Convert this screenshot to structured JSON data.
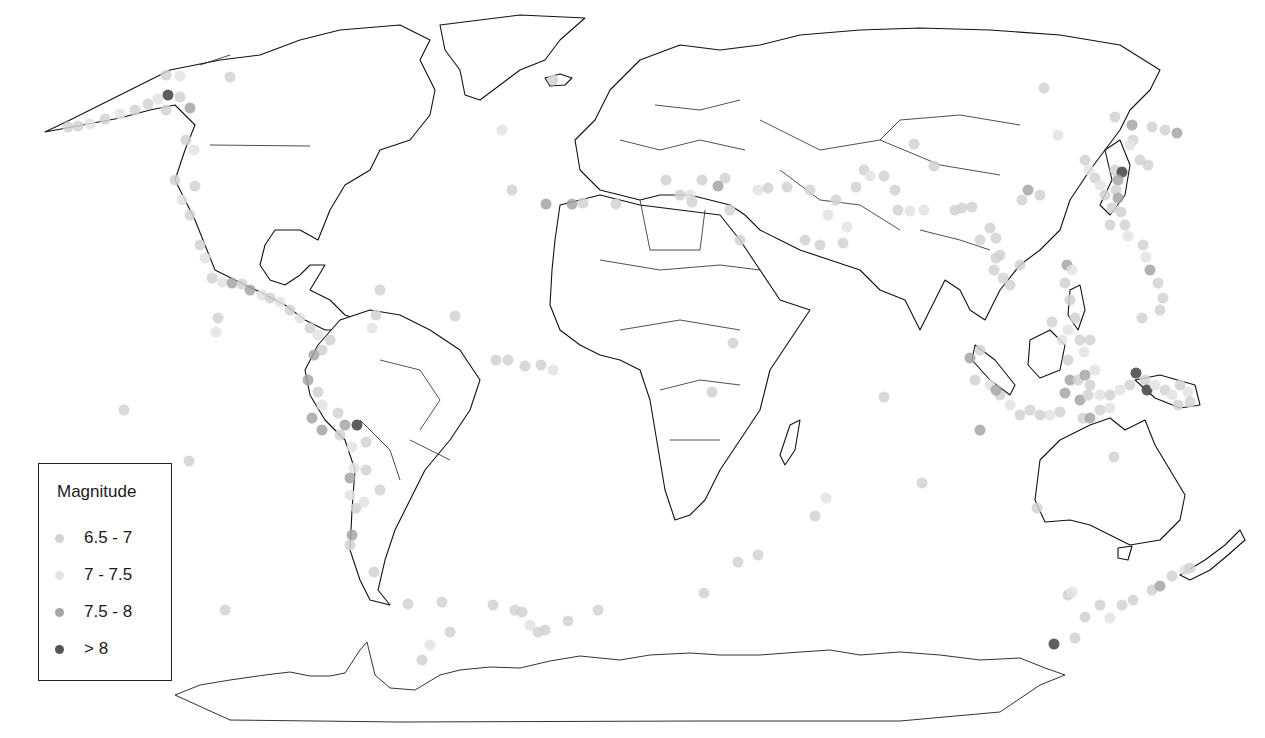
{
  "map": {
    "type": "world earthquake map",
    "projection": "equirectangular (approx)"
  },
  "legend": {
    "title": "Magnitude",
    "items": [
      {
        "label": "6.5 - 7",
        "color": "#d2d2d2"
      },
      {
        "label": "7 - 7.5",
        "color": "#e3e3e3"
      },
      {
        "label": "7.5 - 8",
        "color": "#a6a6a6"
      },
      {
        "label": "> 8",
        "color": "#555555"
      }
    ]
  },
  "colors": {
    "m65": "#d2d2d2",
    "m70": "#e3e3e3",
    "m75": "#a6a6a6",
    "m80": "#555555",
    "outline": "#111111"
  },
  "points": [
    {
      "x": 68,
      "y": 127,
      "c": "m65"
    },
    {
      "x": 78,
      "y": 126,
      "c": "m65"
    },
    {
      "x": 90,
      "y": 124,
      "c": "m70"
    },
    {
      "x": 105,
      "y": 119,
      "c": "m65"
    },
    {
      "x": 120,
      "y": 114,
      "c": "m70"
    },
    {
      "x": 135,
      "y": 110,
      "c": "m65"
    },
    {
      "x": 148,
      "y": 104,
      "c": "m65"
    },
    {
      "x": 158,
      "y": 99,
      "c": "m70"
    },
    {
      "x": 168,
      "y": 95,
      "c": "m80"
    },
    {
      "x": 180,
      "y": 97,
      "c": "m65"
    },
    {
      "x": 190,
      "y": 108,
      "c": "m75"
    },
    {
      "x": 166,
      "y": 75,
      "c": "m65"
    },
    {
      "x": 180,
      "y": 76,
      "c": "m70"
    },
    {
      "x": 230,
      "y": 77,
      "c": "m65"
    },
    {
      "x": 166,
      "y": 110,
      "c": "m65"
    },
    {
      "x": 186,
      "y": 140,
      "c": "m65"
    },
    {
      "x": 194,
      "y": 150,
      "c": "m70"
    },
    {
      "x": 175,
      "y": 180,
      "c": "m65"
    },
    {
      "x": 195,
      "y": 186,
      "c": "m65"
    },
    {
      "x": 182,
      "y": 200,
      "c": "m70"
    },
    {
      "x": 190,
      "y": 215,
      "c": "m65"
    },
    {
      "x": 200,
      "y": 245,
      "c": "m65"
    },
    {
      "x": 205,
      "y": 258,
      "c": "m70"
    },
    {
      "x": 212,
      "y": 278,
      "c": "m65"
    },
    {
      "x": 222,
      "y": 282,
      "c": "m70"
    },
    {
      "x": 232,
      "y": 283,
      "c": "m75"
    },
    {
      "x": 242,
      "y": 284,
      "c": "m65"
    },
    {
      "x": 250,
      "y": 290,
      "c": "m75"
    },
    {
      "x": 262,
      "y": 295,
      "c": "m70"
    },
    {
      "x": 270,
      "y": 298,
      "c": "m65"
    },
    {
      "x": 280,
      "y": 302,
      "c": "m70"
    },
    {
      "x": 290,
      "y": 310,
      "c": "m65"
    },
    {
      "x": 300,
      "y": 318,
      "c": "m70"
    },
    {
      "x": 310,
      "y": 328,
      "c": "m65"
    },
    {
      "x": 318,
      "y": 335,
      "c": "m70"
    },
    {
      "x": 322,
      "y": 350,
      "c": "m65"
    },
    {
      "x": 330,
      "y": 340,
      "c": "m65"
    },
    {
      "x": 218,
      "y": 318,
      "c": "m65"
    },
    {
      "x": 216,
      "y": 332,
      "c": "m70"
    },
    {
      "x": 314,
      "y": 355,
      "c": "m75"
    },
    {
      "x": 308,
      "y": 380,
      "c": "m75"
    },
    {
      "x": 318,
      "y": 392,
      "c": "m65"
    },
    {
      "x": 322,
      "y": 405,
      "c": "m70"
    },
    {
      "x": 312,
      "y": 418,
      "c": "m75"
    },
    {
      "x": 322,
      "y": 430,
      "c": "m75"
    },
    {
      "x": 338,
      "y": 413,
      "c": "m65"
    },
    {
      "x": 345,
      "y": 425,
      "c": "m75"
    },
    {
      "x": 357,
      "y": 425,
      "c": "m80"
    },
    {
      "x": 340,
      "y": 435,
      "c": "m65"
    },
    {
      "x": 352,
      "y": 447,
      "c": "m70"
    },
    {
      "x": 366,
      "y": 442,
      "c": "m65"
    },
    {
      "x": 354,
      "y": 468,
      "c": "m70"
    },
    {
      "x": 350,
      "y": 478,
      "c": "m75"
    },
    {
      "x": 366,
      "y": 470,
      "c": "m65"
    },
    {
      "x": 380,
      "y": 490,
      "c": "m65"
    },
    {
      "x": 350,
      "y": 495,
      "c": "m70"
    },
    {
      "x": 356,
      "y": 508,
      "c": "m65"
    },
    {
      "x": 364,
      "y": 502,
      "c": "m70"
    },
    {
      "x": 352,
      "y": 535,
      "c": "m75"
    },
    {
      "x": 350,
      "y": 545,
      "c": "m65"
    },
    {
      "x": 374,
      "y": 572,
      "c": "m65"
    },
    {
      "x": 408,
      "y": 604,
      "c": "m65"
    },
    {
      "x": 376,
      "y": 315,
      "c": "m65"
    },
    {
      "x": 372,
      "y": 328,
      "c": "m70"
    },
    {
      "x": 380,
      "y": 290,
      "c": "m65"
    },
    {
      "x": 124,
      "y": 410,
      "c": "m65"
    },
    {
      "x": 189,
      "y": 461,
      "c": "m65"
    },
    {
      "x": 225,
      "y": 610,
      "c": "m65"
    },
    {
      "x": 455,
      "y": 316,
      "c": "m65"
    },
    {
      "x": 496,
      "y": 360,
      "c": "m65"
    },
    {
      "x": 508,
      "y": 360,
      "c": "m65"
    },
    {
      "x": 525,
      "y": 366,
      "c": "m65"
    },
    {
      "x": 541,
      "y": 365,
      "c": "m65"
    },
    {
      "x": 553,
      "y": 370,
      "c": "m70"
    },
    {
      "x": 512,
      "y": 190,
      "c": "m65"
    },
    {
      "x": 502,
      "y": 130,
      "c": "m70"
    },
    {
      "x": 553,
      "y": 80,
      "c": "m65"
    },
    {
      "x": 546,
      "y": 204,
      "c": "m75"
    },
    {
      "x": 572,
      "y": 204,
      "c": "m75"
    },
    {
      "x": 583,
      "y": 203,
      "c": "m65"
    },
    {
      "x": 616,
      "y": 204,
      "c": "m65"
    },
    {
      "x": 666,
      "y": 180,
      "c": "m65"
    },
    {
      "x": 680,
      "y": 195,
      "c": "m65"
    },
    {
      "x": 690,
      "y": 195,
      "c": "m70"
    },
    {
      "x": 692,
      "y": 202,
      "c": "m65"
    },
    {
      "x": 702,
      "y": 180,
      "c": "m65"
    },
    {
      "x": 718,
      "y": 186,
      "c": "m75"
    },
    {
      "x": 725,
      "y": 178,
      "c": "m65"
    },
    {
      "x": 730,
      "y": 210,
      "c": "m65"
    },
    {
      "x": 740,
      "y": 240,
      "c": "m65"
    },
    {
      "x": 758,
      "y": 190,
      "c": "m70"
    },
    {
      "x": 768,
      "y": 188,
      "c": "m65"
    },
    {
      "x": 787,
      "y": 187,
      "c": "m65"
    },
    {
      "x": 810,
      "y": 190,
      "c": "m65"
    },
    {
      "x": 805,
      "y": 240,
      "c": "m65"
    },
    {
      "x": 820,
      "y": 245,
      "c": "m65"
    },
    {
      "x": 828,
      "y": 215,
      "c": "m70"
    },
    {
      "x": 836,
      "y": 200,
      "c": "m65"
    },
    {
      "x": 843,
      "y": 243,
      "c": "m65"
    },
    {
      "x": 847,
      "y": 227,
      "c": "m70"
    },
    {
      "x": 856,
      "y": 187,
      "c": "m65"
    },
    {
      "x": 864,
      "y": 170,
      "c": "m65"
    },
    {
      "x": 870,
      "y": 176,
      "c": "m70"
    },
    {
      "x": 884,
      "y": 176,
      "c": "m65"
    },
    {
      "x": 895,
      "y": 190,
      "c": "m65"
    },
    {
      "x": 898,
      "y": 210,
      "c": "m65"
    },
    {
      "x": 910,
      "y": 211,
      "c": "m70"
    },
    {
      "x": 914,
      "y": 144,
      "c": "m65"
    },
    {
      "x": 934,
      "y": 166,
      "c": "m65"
    },
    {
      "x": 955,
      "y": 210,
      "c": "m65"
    },
    {
      "x": 962,
      "y": 208,
      "c": "m65"
    },
    {
      "x": 972,
      "y": 207,
      "c": "m65"
    },
    {
      "x": 924,
      "y": 210,
      "c": "m70"
    },
    {
      "x": 980,
      "y": 240,
      "c": "m65"
    },
    {
      "x": 990,
      "y": 228,
      "c": "m65"
    },
    {
      "x": 996,
      "y": 238,
      "c": "m65"
    },
    {
      "x": 996,
      "y": 258,
      "c": "m65"
    },
    {
      "x": 1000,
      "y": 255,
      "c": "m65"
    },
    {
      "x": 994,
      "y": 270,
      "c": "m65"
    },
    {
      "x": 1003,
      "y": 278,
      "c": "m65"
    },
    {
      "x": 1010,
      "y": 285,
      "c": "m65"
    },
    {
      "x": 1020,
      "y": 265,
      "c": "m65"
    },
    {
      "x": 1028,
      "y": 190,
      "c": "m75"
    },
    {
      "x": 1022,
      "y": 200,
      "c": "m65"
    },
    {
      "x": 1040,
      "y": 195,
      "c": "m65"
    },
    {
      "x": 1058,
      "y": 135,
      "c": "m70"
    },
    {
      "x": 1067,
      "y": 265,
      "c": "m75"
    },
    {
      "x": 1072,
      "y": 270,
      "c": "m70"
    },
    {
      "x": 1065,
      "y": 283,
      "c": "m65"
    },
    {
      "x": 1070,
      "y": 300,
      "c": "m65"
    },
    {
      "x": 1075,
      "y": 318,
      "c": "m65"
    },
    {
      "x": 1068,
      "y": 330,
      "c": "m70"
    },
    {
      "x": 1080,
      "y": 340,
      "c": "m65"
    },
    {
      "x": 1090,
      "y": 340,
      "c": "m65"
    },
    {
      "x": 1084,
      "y": 352,
      "c": "m70"
    },
    {
      "x": 1085,
      "y": 160,
      "c": "m65"
    },
    {
      "x": 1089,
      "y": 170,
      "c": "m70"
    },
    {
      "x": 1095,
      "y": 178,
      "c": "m65"
    },
    {
      "x": 1100,
      "y": 185,
      "c": "m70"
    },
    {
      "x": 1105,
      "y": 195,
      "c": "m65"
    },
    {
      "x": 1112,
      "y": 208,
      "c": "m65"
    },
    {
      "x": 1115,
      "y": 170,
      "c": "m65"
    },
    {
      "x": 1122,
      "y": 172,
      "c": "m80"
    },
    {
      "x": 1118,
      "y": 180,
      "c": "m75"
    },
    {
      "x": 1116,
      "y": 190,
      "c": "m65"
    },
    {
      "x": 1118,
      "y": 198,
      "c": "m75"
    },
    {
      "x": 1121,
      "y": 212,
      "c": "m65"
    },
    {
      "x": 1110,
      "y": 225,
      "c": "m65"
    },
    {
      "x": 1125,
      "y": 225,
      "c": "m65"
    },
    {
      "x": 1128,
      "y": 236,
      "c": "m70"
    },
    {
      "x": 1140,
      "y": 160,
      "c": "m65"
    },
    {
      "x": 1148,
      "y": 165,
      "c": "m65"
    },
    {
      "x": 1132,
      "y": 125,
      "c": "m75"
    },
    {
      "x": 1133,
      "y": 140,
      "c": "m65"
    },
    {
      "x": 1130,
      "y": 145,
      "c": "m70"
    },
    {
      "x": 1115,
      "y": 117,
      "c": "m65"
    },
    {
      "x": 1152,
      "y": 127,
      "c": "m65"
    },
    {
      "x": 1165,
      "y": 130,
      "c": "m65"
    },
    {
      "x": 1177,
      "y": 133,
      "c": "m75"
    },
    {
      "x": 1044,
      "y": 88,
      "c": "m65"
    },
    {
      "x": 1143,
      "y": 245,
      "c": "m65"
    },
    {
      "x": 1146,
      "y": 257,
      "c": "m70"
    },
    {
      "x": 1150,
      "y": 270,
      "c": "m75"
    },
    {
      "x": 1158,
      "y": 283,
      "c": "m65"
    },
    {
      "x": 1163,
      "y": 298,
      "c": "m65"
    },
    {
      "x": 1160,
      "y": 310,
      "c": "m65"
    },
    {
      "x": 1142,
      "y": 318,
      "c": "m65"
    },
    {
      "x": 1052,
      "y": 322,
      "c": "m65"
    },
    {
      "x": 1062,
      "y": 340,
      "c": "m70"
    },
    {
      "x": 1068,
      "y": 360,
      "c": "m65"
    },
    {
      "x": 1070,
      "y": 380,
      "c": "m75"
    },
    {
      "x": 1078,
      "y": 380,
      "c": "m65"
    },
    {
      "x": 1085,
      "y": 375,
      "c": "m75"
    },
    {
      "x": 1090,
      "y": 385,
      "c": "m65"
    },
    {
      "x": 1095,
      "y": 370,
      "c": "m70"
    },
    {
      "x": 1080,
      "y": 400,
      "c": "m75"
    },
    {
      "x": 1088,
      "y": 395,
      "c": "m65"
    },
    {
      "x": 1100,
      "y": 395,
      "c": "m70"
    },
    {
      "x": 1110,
      "y": 395,
      "c": "m65"
    },
    {
      "x": 1120,
      "y": 390,
      "c": "m70"
    },
    {
      "x": 1130,
      "y": 385,
      "c": "m65"
    },
    {
      "x": 1136,
      "y": 373,
      "c": "m80"
    },
    {
      "x": 1145,
      "y": 380,
      "c": "m65"
    },
    {
      "x": 1147,
      "y": 390,
      "c": "m80"
    },
    {
      "x": 1155,
      "y": 385,
      "c": "m70"
    },
    {
      "x": 1165,
      "y": 390,
      "c": "m65"
    },
    {
      "x": 1172,
      "y": 395,
      "c": "m70"
    },
    {
      "x": 1180,
      "y": 385,
      "c": "m65"
    },
    {
      "x": 1188,
      "y": 392,
      "c": "m70"
    },
    {
      "x": 1190,
      "y": 402,
      "c": "m65"
    },
    {
      "x": 1178,
      "y": 405,
      "c": "m65"
    },
    {
      "x": 1100,
      "y": 410,
      "c": "m65"
    },
    {
      "x": 1110,
      "y": 408,
      "c": "m70"
    },
    {
      "x": 1060,
      "y": 412,
      "c": "m65"
    },
    {
      "x": 1050,
      "y": 415,
      "c": "m70"
    },
    {
      "x": 1040,
      "y": 415,
      "c": "m65"
    },
    {
      "x": 1020,
      "y": 415,
      "c": "m65"
    },
    {
      "x": 1010,
      "y": 405,
      "c": "m70"
    },
    {
      "x": 1000,
      "y": 395,
      "c": "m65"
    },
    {
      "x": 990,
      "y": 385,
      "c": "m70"
    },
    {
      "x": 975,
      "y": 380,
      "c": "m65"
    },
    {
      "x": 970,
      "y": 358,
      "c": "m75"
    },
    {
      "x": 980,
      "y": 350,
      "c": "m65"
    },
    {
      "x": 996,
      "y": 390,
      "c": "m75"
    },
    {
      "x": 1030,
      "y": 410,
      "c": "m65"
    },
    {
      "x": 1065,
      "y": 393,
      "c": "m75"
    },
    {
      "x": 1083,
      "y": 418,
      "c": "m65"
    },
    {
      "x": 1090,
      "y": 418,
      "c": "m75"
    },
    {
      "x": 980,
      "y": 430,
      "c": "m75"
    },
    {
      "x": 884,
      "y": 397,
      "c": "m65"
    },
    {
      "x": 922,
      "y": 483,
      "c": "m65"
    },
    {
      "x": 1114,
      "y": 457,
      "c": "m65"
    },
    {
      "x": 1037,
      "y": 508,
      "c": "m65"
    },
    {
      "x": 712,
      "y": 392,
      "c": "m65"
    },
    {
      "x": 733,
      "y": 343,
      "c": "m65"
    },
    {
      "x": 738,
      "y": 562,
      "c": "m65"
    },
    {
      "x": 758,
      "y": 555,
      "c": "m65"
    },
    {
      "x": 704,
      "y": 593,
      "c": "m65"
    },
    {
      "x": 815,
      "y": 516,
      "c": "m65"
    },
    {
      "x": 826,
      "y": 498,
      "c": "m70"
    },
    {
      "x": 1068,
      "y": 595,
      "c": "m65"
    },
    {
      "x": 1072,
      "y": 592,
      "c": "m70"
    },
    {
      "x": 1085,
      "y": 617,
      "c": "m65"
    },
    {
      "x": 1100,
      "y": 605,
      "c": "m65"
    },
    {
      "x": 1110,
      "y": 618,
      "c": "m70"
    },
    {
      "x": 1122,
      "y": 605,
      "c": "m65"
    },
    {
      "x": 1133,
      "y": 600,
      "c": "m65"
    },
    {
      "x": 1152,
      "y": 590,
      "c": "m65"
    },
    {
      "x": 1160,
      "y": 586,
      "c": "m75"
    },
    {
      "x": 1172,
      "y": 576,
      "c": "m65"
    },
    {
      "x": 1185,
      "y": 570,
      "c": "m70"
    },
    {
      "x": 1190,
      "y": 568,
      "c": "m65"
    },
    {
      "x": 1054,
      "y": 644,
      "c": "m80"
    },
    {
      "x": 1075,
      "y": 638,
      "c": "m65"
    },
    {
      "x": 515,
      "y": 610,
      "c": "m65"
    },
    {
      "x": 522,
      "y": 612,
      "c": "m65"
    },
    {
      "x": 530,
      "y": 625,
      "c": "m70"
    },
    {
      "x": 545,
      "y": 630,
      "c": "m65"
    },
    {
      "x": 538,
      "y": 632,
      "c": "m65"
    },
    {
      "x": 568,
      "y": 621,
      "c": "m65"
    },
    {
      "x": 598,
      "y": 610,
      "c": "m65"
    },
    {
      "x": 442,
      "y": 602,
      "c": "m65"
    },
    {
      "x": 450,
      "y": 632,
      "c": "m65"
    },
    {
      "x": 430,
      "y": 645,
      "c": "m70"
    },
    {
      "x": 493,
      "y": 605,
      "c": "m65"
    },
    {
      "x": 422,
      "y": 660,
      "c": "m65"
    }
  ]
}
